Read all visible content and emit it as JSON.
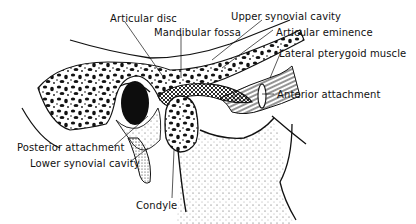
{
  "diagram": {
    "ink_color": "#111111",
    "background": "#ffffff",
    "labels": [
      {
        "id": "articular_disc",
        "text": "Articular disc",
        "x": 110,
        "y": 13
      },
      {
        "id": "mandibular_fossa",
        "text": "Mandibular fossa",
        "x": 154,
        "y": 27
      },
      {
        "id": "upper_synovial_cavity",
        "text": "Upper synovial cavity",
        "x": 231,
        "y": 11
      },
      {
        "id": "articular_eminence",
        "text": "Articular eminence",
        "x": 276,
        "y": 27
      },
      {
        "id": "lateral_pterygoid_muscle",
        "text": "Lateral pterygoid muscle",
        "x": 279,
        "y": 48
      },
      {
        "id": "anterior_attachment",
        "text": "Anterior attachment",
        "x": 277,
        "y": 89
      },
      {
        "id": "posterior_attachment",
        "text": "Posterior attachment",
        "x": 17,
        "y": 142
      },
      {
        "id": "lower_synovial_cavity",
        "text": "Lower synovial cavity",
        "x": 30,
        "y": 158
      },
      {
        "id": "condyle",
        "text": "Condyle",
        "x": 136,
        "y": 200
      }
    ]
  }
}
